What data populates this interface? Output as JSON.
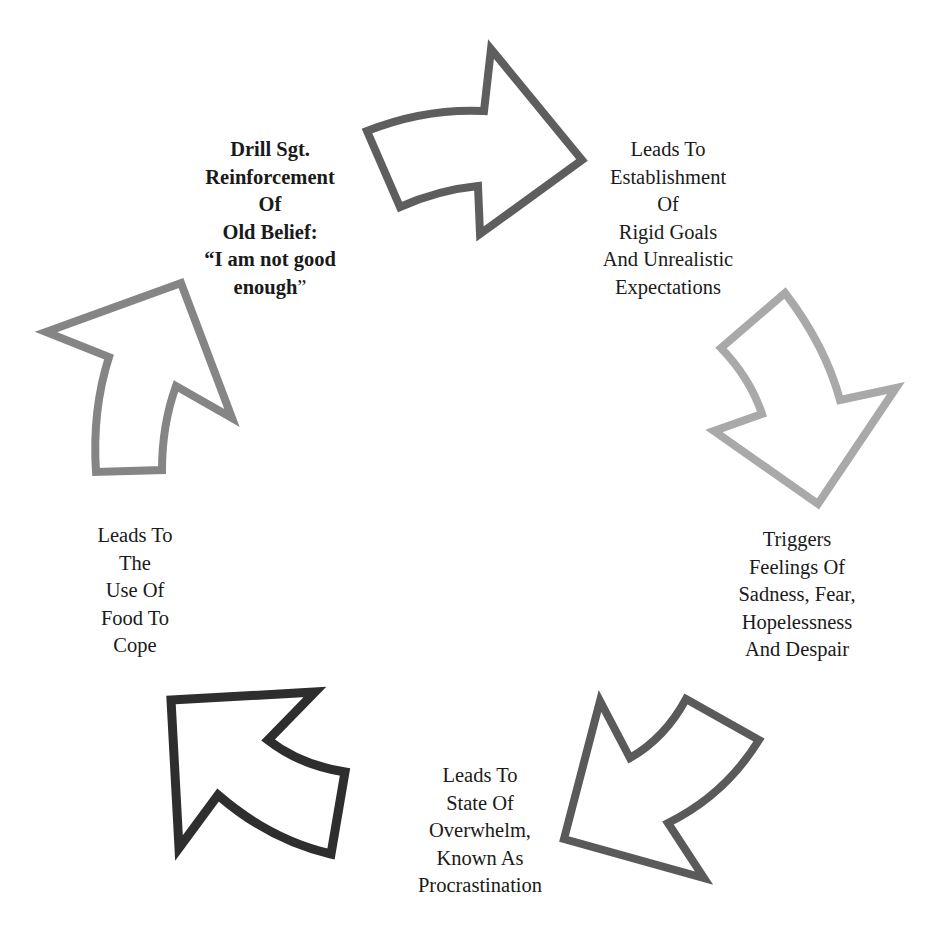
{
  "diagram": {
    "type": "cycle",
    "direction": "clockwise",
    "stages": [
      {
        "id": "drill-sgt",
        "position": "top-left",
        "bold": true,
        "lines": [
          "Drill Sgt.",
          "Reinforcement",
          "Of",
          "Old Belief:",
          "“I am not good",
          "enough"
        ],
        "trailing_quote": "”"
      },
      {
        "id": "rigid-goals",
        "position": "top-right",
        "bold": false,
        "lines": [
          "Leads To",
          "Establishment",
          "Of",
          "Rigid Goals",
          "And Unrealistic",
          "Expectations"
        ]
      },
      {
        "id": "feelings",
        "position": "right",
        "bold": false,
        "lines": [
          "Triggers",
          "Feelings Of",
          "Sadness, Fear,",
          "Hopelessness",
          "And Despair"
        ]
      },
      {
        "id": "overwhelm",
        "position": "bottom",
        "bold": false,
        "lines": [
          "Leads To",
          "State Of",
          "Overwhelm,",
          "Known As",
          "Procrastination"
        ]
      },
      {
        "id": "food",
        "position": "left",
        "bold": false,
        "lines": [
          "Leads To",
          "The",
          "Use Of",
          "Food To",
          "Cope"
        ]
      }
    ],
    "arrows": [
      {
        "id": "arrow-top",
        "from": "drill-sgt",
        "to": "rigid-goals",
        "direction": "right",
        "color": "#5e5e5e"
      },
      {
        "id": "arrow-right",
        "from": "rigid-goals",
        "to": "feelings",
        "direction": "down",
        "color": "#a9a9a9"
      },
      {
        "id": "arrow-bottom-right",
        "from": "feelings",
        "to": "overwhelm",
        "direction": "down-left",
        "color": "#5a5a5a"
      },
      {
        "id": "arrow-bottom-left",
        "from": "overwhelm",
        "to": "food",
        "direction": "up-left",
        "color": "#2e2e2e"
      },
      {
        "id": "arrow-left",
        "from": "food",
        "to": "drill-sgt",
        "direction": "up",
        "color": "#858585"
      }
    ]
  }
}
